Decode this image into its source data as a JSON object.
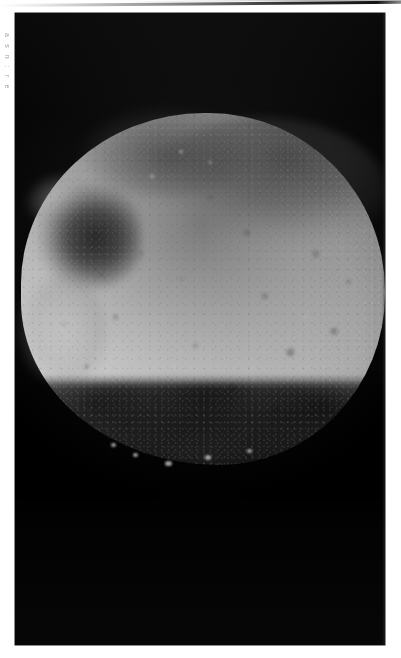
{
  "page": {
    "background_color": "#ffffff",
    "scan_artifact": {
      "name": "top-scan-line",
      "color": "#1a1a1a"
    },
    "margin_caption": {
      "text": "a s n : r e",
      "color": "#8e8e8e"
    }
  },
  "photo": {
    "title": "",
    "plate_background": "#020202",
    "subject": "cratered-moon",
    "bounds": {
      "left": 15,
      "top": 13,
      "width": 370,
      "height": 632
    },
    "body": {
      "name": "moon-disc",
      "highlight_color": "#f2f2f2",
      "midtone_color": "#bcbcbc",
      "limb_shadow_color": "#151515",
      "terminator": "bottom"
    },
    "features": [
      {
        "name": "dark-terrain-band-upper-limb",
        "tone": "#3c3c3c"
      },
      {
        "name": "large-shadowed-crater-upper-left",
        "tone": "#0a0a0a"
      },
      {
        "name": "bright-crater-rim-upper-left",
        "tone": "#ebebeb"
      },
      {
        "name": "bright-limb-lobe-left",
        "tone": "#e6e6e6"
      },
      {
        "name": "ragged-terminator-bottom",
        "tone": "#000000"
      },
      {
        "name": "crater-speckle-field",
        "tone": "#6e6e6e"
      }
    ]
  }
}
